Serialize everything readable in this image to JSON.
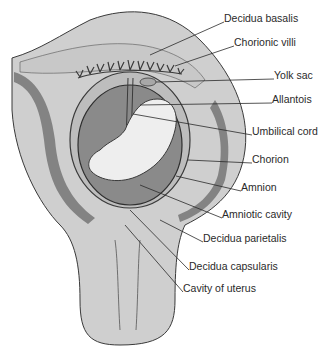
{
  "diagram": {
    "colors": {
      "uterine_wall": "#cfcfcf",
      "decidua": "#c4c4c4",
      "amniotic_cavity": "#8a8a8a",
      "embryo": "#eeeeee",
      "outline": "#3a3a3a",
      "hatch": "#555555",
      "label_text": "#2a2a2a"
    },
    "labels": [
      {
        "id": "decidua-basalis",
        "text": "Decidua basalis",
        "x": 224,
        "y": 18
      },
      {
        "id": "chorionic-villi",
        "text": "Chorionic villi",
        "x": 234,
        "y": 42
      },
      {
        "id": "yolk-sac",
        "text": "Yolk sac",
        "x": 274,
        "y": 75
      },
      {
        "id": "allantois",
        "text": "Allantois",
        "x": 272,
        "y": 99
      },
      {
        "id": "umbilical-cord",
        "text": "Umbilical cord",
        "x": 252,
        "y": 131
      },
      {
        "id": "chorion",
        "text": "Chorion",
        "x": 252,
        "y": 159
      },
      {
        "id": "amnion",
        "text": "Amnion",
        "x": 241,
        "y": 187
      },
      {
        "id": "amniotic-cavity",
        "text": "Amniotic cavity",
        "x": 222,
        "y": 214
      },
      {
        "id": "decidua-parietalis",
        "text": "Decidua parietalis",
        "x": 203,
        "y": 238
      },
      {
        "id": "decidua-capsularis",
        "text": "Decidua capsularis",
        "x": 189,
        "y": 266
      },
      {
        "id": "cavity-of-uterus",
        "text": "Cavity of uterus",
        "x": 183,
        "y": 288
      }
    ]
  }
}
